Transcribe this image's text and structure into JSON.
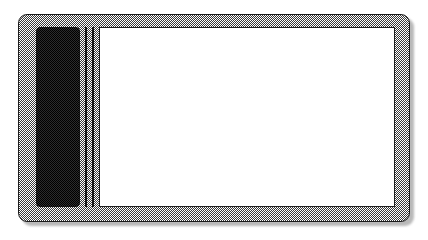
{
  "figure": {
    "style": "halftone-dither-line-art",
    "canvas": {
      "width": 428,
      "height": 240,
      "background_color": "#ffffff"
    }
  },
  "device": {
    "name": "tablet-device",
    "body": {
      "label": "device-body",
      "fill": "halftone-gray",
      "fill_color": "#8a8a8a",
      "outline_color": "#1b1b1b",
      "corner_radius": 9,
      "x": 18,
      "y": 14,
      "width": 392,
      "height": 208,
      "has_drop_shadow": true,
      "shadow_color": "#b9b9b9"
    },
    "side_panel": {
      "label": "left-dark-panel",
      "fill_color": "#2b2b2b",
      "outline_color": "#101010",
      "corner_radius": 4,
      "x": 36,
      "y": 27,
      "width": 44,
      "height": 180
    },
    "divider_lines": [
      {
        "label": "divider-line-1",
        "x": 85,
        "y": 27,
        "width": 1.6,
        "height": 180,
        "color": "#141414"
      },
      {
        "label": "divider-line-2",
        "x": 92,
        "y": 27,
        "width": 1.6,
        "height": 180,
        "color": "#141414"
      }
    ],
    "screen": {
      "label": "main-screen",
      "fill_color": "#ffffff",
      "outline_color": "#1d1d1d",
      "corner_radius": 0,
      "x": 99,
      "y": 27,
      "width": 296,
      "height": 180,
      "content": ""
    }
  }
}
